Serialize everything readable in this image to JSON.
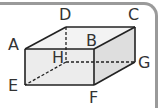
{
  "figure": {
    "type": "rectangular-prism",
    "colors": {
      "frame": "#9a9a9a",
      "edge": "#222222",
      "front_face": "#ececec",
      "top_face": "#f3f3f3",
      "right_face": "#dedede"
    },
    "vertices": {
      "A": {
        "label": "A",
        "x": 25,
        "y": 49
      },
      "B": {
        "label": "B",
        "x": 94,
        "y": 49
      },
      "C": {
        "label": "C",
        "x": 135,
        "y": 27
      },
      "D": {
        "label": "D",
        "x": 66,
        "y": 27
      },
      "E": {
        "label": "E",
        "x": 25,
        "y": 85
      },
      "F": {
        "label": "F",
        "x": 94,
        "y": 85
      },
      "G": {
        "label": "G",
        "x": 135,
        "y": 62
      },
      "H": {
        "label": "H",
        "x": 66,
        "y": 62
      }
    },
    "hidden_edges": [
      "DH",
      "HE",
      "HG"
    ]
  }
}
